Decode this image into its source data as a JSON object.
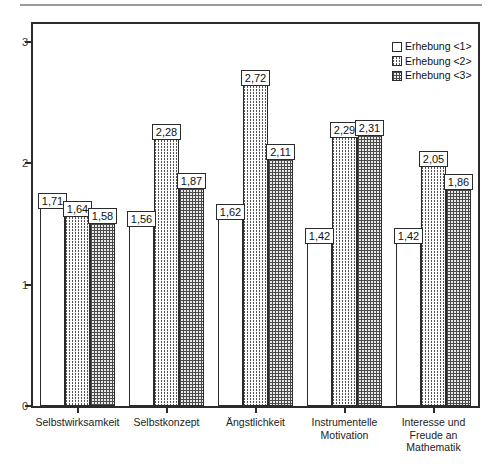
{
  "chart_data": {
    "type": "bar",
    "title": "",
    "subtitle": "",
    "xlabel": "",
    "ylabel": "",
    "ylim": [
      0,
      3.15
    ],
    "yticks": [
      "0",
      "1",
      "2",
      "3"
    ],
    "ytick_values": [
      0,
      1,
      2,
      3
    ],
    "grid": false,
    "legend_position": "top-right",
    "decimal_separator": ",",
    "categories": [
      "Selbstwirksamkeit",
      "Selbstkonzept",
      "Ängstlichkeit",
      "Instrumentelle\nMotivation",
      "Interesse und\nFreude an\nMathematik"
    ],
    "series": [
      {
        "name": "Erhebung <1>",
        "pattern": "empty",
        "values": [
          1.71,
          1.56,
          1.62,
          1.42,
          1.42
        ],
        "labels": [
          "1,71",
          "1,56",
          "1,62",
          "1,42",
          "1,42"
        ]
      },
      {
        "name": "Erhebung <2>",
        "pattern": "vertical-dotted",
        "values": [
          1.64,
          2.28,
          2.72,
          2.29,
          2.05
        ],
        "labels": [
          "1,64",
          "2,28",
          "2,72",
          "2,29",
          "2,05"
        ]
      },
      {
        "name": "Erhebung <3>",
        "pattern": "checkered-dots",
        "values": [
          1.58,
          1.87,
          2.11,
          2.31,
          1.86
        ],
        "labels": [
          "1,58",
          "1,87",
          "2,11",
          "2,31",
          "1,86"
        ]
      }
    ]
  },
  "legend": {
    "items": [
      {
        "label": "Erhebung <1>",
        "pattern": "empty"
      },
      {
        "label": "Erhebung <2>",
        "pattern": "vertical-dotted"
      },
      {
        "label": "Erhebung <3>",
        "pattern": "checkered-dots"
      }
    ]
  },
  "axis": {
    "y_ticks": [
      "0",
      "1",
      "2",
      "3"
    ]
  }
}
